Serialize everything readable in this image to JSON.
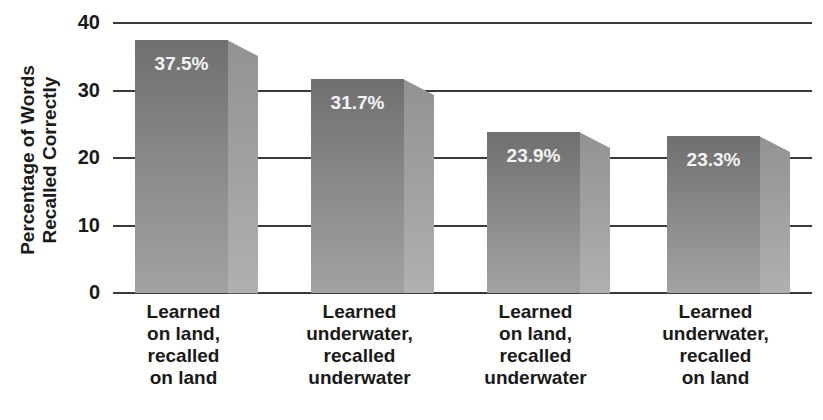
{
  "chart_data": {
    "type": "bar",
    "title": "",
    "xlabel": "",
    "ylabel": "Percentage of Words Recalled Correctly",
    "ylabel_lines": [
      "Percentage of Words",
      "Recalled Correctly"
    ],
    "ylim": [
      0,
      40
    ],
    "yticks": [
      "0",
      "10",
      "20",
      "30",
      "40"
    ],
    "grid": true,
    "categories": [
      "Learned on land, recalled on land",
      "Learned underwater, recalled underwater",
      "Learned on land, recalled underwater",
      "Learned underwater, recalled on land"
    ],
    "category_lines": [
      [
        "Learned",
        "on land,",
        "recalled",
        "on land"
      ],
      [
        "Learned",
        "underwater,",
        "recalled",
        "underwater"
      ],
      [
        "Learned",
        "on land,",
        "recalled",
        "underwater"
      ],
      [
        "Learned",
        "underwater,",
        "recalled",
        "on land"
      ]
    ],
    "values": [
      37.5,
      31.7,
      23.9,
      23.3
    ],
    "value_labels": [
      "37.5%",
      "31.7%",
      "23.9%",
      "23.3%"
    ],
    "colors": {
      "front": "#7d7d7d",
      "side": "#a5a5a5",
      "grid": "#3a3a3a"
    }
  }
}
